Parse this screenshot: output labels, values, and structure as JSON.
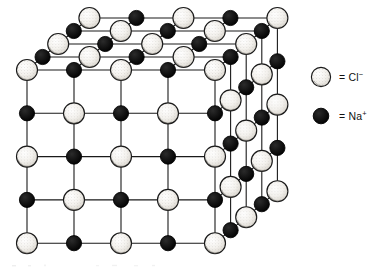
{
  "figure": {
    "background_color": "#ffffff",
    "line_color": "#1a1a1a",
    "projection": "oblique",
    "geometry": {
      "origin_x": 27,
      "origin_y": 70,
      "step_x": 47.0,
      "step_y": 43.3,
      "depth_dx": 15.6,
      "depth_dy": -13.0,
      "grid_cols": 5,
      "grid_rows": 5,
      "grid_layers": 5,
      "bond_width": 1.1
    }
  },
  "ions": {
    "chloride": {
      "symbol": "Cl",
      "charge": "−",
      "label": "= Cl",
      "radius": 10.5,
      "fill_color": "#f2f0ec",
      "stroke_color": "#1a1a1a",
      "style": "stippled-light-sphere"
    },
    "sodium": {
      "symbol": "Na",
      "charge": "+",
      "label": "= Na",
      "radius": 7.6,
      "fill_color": "#0d0d0d",
      "stroke_color": "#000000",
      "style": "solid-dark-sphere"
    }
  },
  "legend": {
    "items": [
      {
        "ion": "chloride",
        "equals": "=",
        "species": "Cl",
        "charge": "−",
        "full_label": "= Cl⁻"
      },
      {
        "ion": "sodium",
        "equals": "=",
        "species": "Na",
        "charge": "+",
        "full_label": "= Na⁺"
      }
    ]
  }
}
